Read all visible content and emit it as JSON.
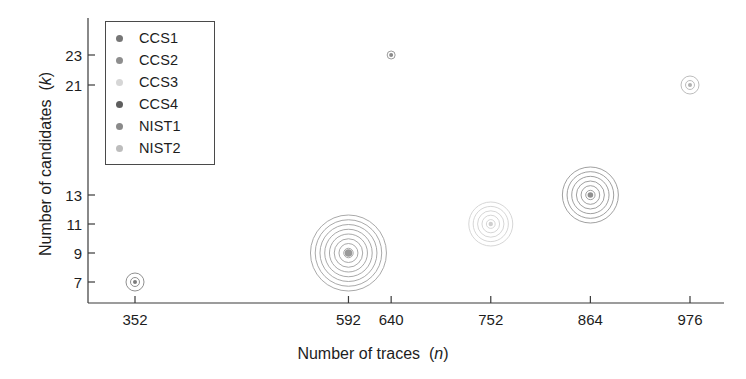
{
  "chart_data": {
    "type": "scatter",
    "title": "",
    "xlabel": "Number of traces (n)",
    "xlabel_text": "Number of traces",
    "xlabel_var": "n",
    "ylabel": "Number of candidates (k)",
    "ylabel_text": "Number of candidates",
    "ylabel_var": "k",
    "xticks": [
      352,
      592,
      640,
      752,
      864,
      976
    ],
    "xtick_labels": [
      "352",
      "592",
      "640",
      "752",
      "864",
      "976"
    ],
    "yticks": [
      7,
      9,
      11,
      13,
      21,
      23
    ],
    "ytick_labels": [
      "7",
      "9",
      "11",
      "13",
      "21",
      "23"
    ],
    "xlim": [
      300,
      1010
    ],
    "ylim": [
      6,
      24
    ],
    "grid": false,
    "legend_position": "upper-left",
    "points": [
      {
        "series": "CCS1",
        "x": 352,
        "y": 7,
        "rings": 2,
        "radius": 9,
        "color": "#7c7c7c"
      },
      {
        "series": "CCS2",
        "x": 592,
        "y": 9,
        "rings": 8,
        "radius": 38,
        "color": "#9a9a9a"
      },
      {
        "series": "CCS4",
        "x": 640,
        "y": 23,
        "rings": 1,
        "radius": 4,
        "color": "#8a8a8a"
      },
      {
        "series": "CCS3",
        "x": 752,
        "y": 11,
        "rings": 5,
        "radius": 22,
        "color": "#cfcfcf"
      },
      {
        "series": "NIST1",
        "x": 864,
        "y": 13,
        "rings": 6,
        "radius": 28,
        "color": "#8f8f8f"
      },
      {
        "series": "NIST2",
        "x": 976,
        "y": 21,
        "rings": 2,
        "radius": 9,
        "color": "#b0b0b0"
      }
    ],
    "series": [
      {
        "name": "CCS1",
        "color": "#767676",
        "x": [
          352
        ],
        "values": [
          7
        ]
      },
      {
        "name": "CCS2",
        "color": "#8e8e8e",
        "x": [
          592
        ],
        "values": [
          9
        ]
      },
      {
        "name": "CCS3",
        "color": "#d6d6d6",
        "x": [
          752
        ],
        "values": [
          11
        ]
      },
      {
        "name": "CCS4",
        "color": "#5e5e5e",
        "x": [
          640
        ],
        "values": [
          23
        ]
      },
      {
        "name": "NIST1",
        "color": "#8a8a8a",
        "x": [
          864
        ],
        "values": [
          13
        ]
      },
      {
        "name": "NIST2",
        "color": "#bdbdbd",
        "x": [
          976
        ],
        "values": [
          21
        ]
      }
    ]
  },
  "legend": {
    "items": [
      {
        "label": "CCS1",
        "color": "#767676"
      },
      {
        "label": "CCS2",
        "color": "#8e8e8e"
      },
      {
        "label": "CCS3",
        "color": "#d6d6d6"
      },
      {
        "label": "CCS4",
        "color": "#5e5e5e"
      },
      {
        "label": "NIST1",
        "color": "#8a8a8a"
      },
      {
        "label": "NIST2",
        "color": "#bdbdbd"
      }
    ]
  },
  "colors": {
    "axis": "#3a3a3a",
    "text": "#1d1d1d",
    "background": "#ffffff"
  }
}
